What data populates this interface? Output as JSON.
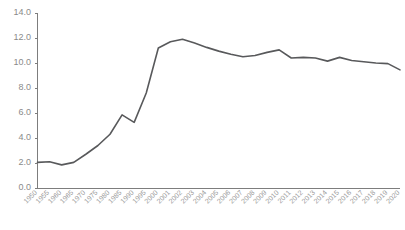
{
  "chart_data": {
    "type": "line",
    "title": "",
    "xlabel": "",
    "ylabel": "",
    "ylim": [
      0.0,
      14.0
    ],
    "ytick_step": 2.0,
    "grid": false,
    "legend": "none",
    "line_color": "#58595b",
    "axis_color": "#7d7d7d",
    "tick_label_color": "#8a8a8a",
    "ytick_labels": [
      "0.0",
      "2.0",
      "4.0",
      "6.0",
      "8.0",
      "10.0",
      "12.0",
      "14.0"
    ],
    "ytick_values": [
      0.0,
      2.0,
      4.0,
      6.0,
      8.0,
      10.0,
      12.0,
      14.0
    ],
    "categories": [
      "1950",
      "1955",
      "1960",
      "1965",
      "1970",
      "1975",
      "1980",
      "1985",
      "1990",
      "1995",
      "2000",
      "2001",
      "2002",
      "2003",
      "2004",
      "2005",
      "2006",
      "2007",
      "2008",
      "2009",
      "2010",
      "2011",
      "2012",
      "2013",
      "2014",
      "2015",
      "2016",
      "2017",
      "2018",
      "2019",
      "2020"
    ],
    "values": [
      2.05,
      2.1,
      1.85,
      2.05,
      2.7,
      3.4,
      4.3,
      5.85,
      5.25,
      7.6,
      11.2,
      11.7,
      11.9,
      11.6,
      11.25,
      10.95,
      10.7,
      10.5,
      10.6,
      10.85,
      11.05,
      10.4,
      10.45,
      10.4,
      10.15,
      10.45,
      10.2,
      10.1,
      10.0,
      9.95,
      9.45
    ]
  }
}
